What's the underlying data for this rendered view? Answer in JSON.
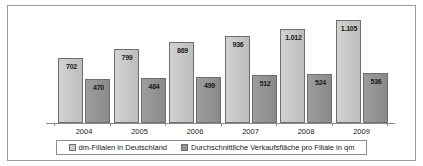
{
  "chart_data": {
    "type": "bar",
    "title": "",
    "xlabel": "",
    "ylabel": "",
    "grid": false,
    "legend_position": "bottom",
    "ylim": [
      0,
      1170
    ],
    "categories": [
      "2004",
      "2005",
      "2006",
      "2007",
      "2008",
      "2009"
    ],
    "series": [
      {
        "name": "dm-Filialen in Deutschland",
        "color": "#cbcbcb",
        "values": [
          702,
          799,
          869,
          936,
          1012,
          1105
        ],
        "labels": [
          "702",
          "799",
          "869",
          "936",
          "1.012",
          "1.105"
        ]
      },
      {
        "name": "Durchschnittliche Verkaufsfläche pro Filiale in qm",
        "color": "#949494",
        "values": [
          470,
          484,
          499,
          512,
          524,
          536
        ],
        "labels": [
          "470",
          "484",
          "499",
          "512",
          "524",
          "536"
        ]
      }
    ]
  },
  "legend": {
    "entries": [
      {
        "label": "dm-Filialen in Deutschland"
      },
      {
        "label": "Durchschnittliche Verkaufsfläche pro Filiale in qm"
      }
    ]
  },
  "colors": {
    "series1": "#cbcbcb",
    "series2": "#949494",
    "frame": "#9a9a9a",
    "axis": "#8d8d8d",
    "background": "#ffffff"
  }
}
